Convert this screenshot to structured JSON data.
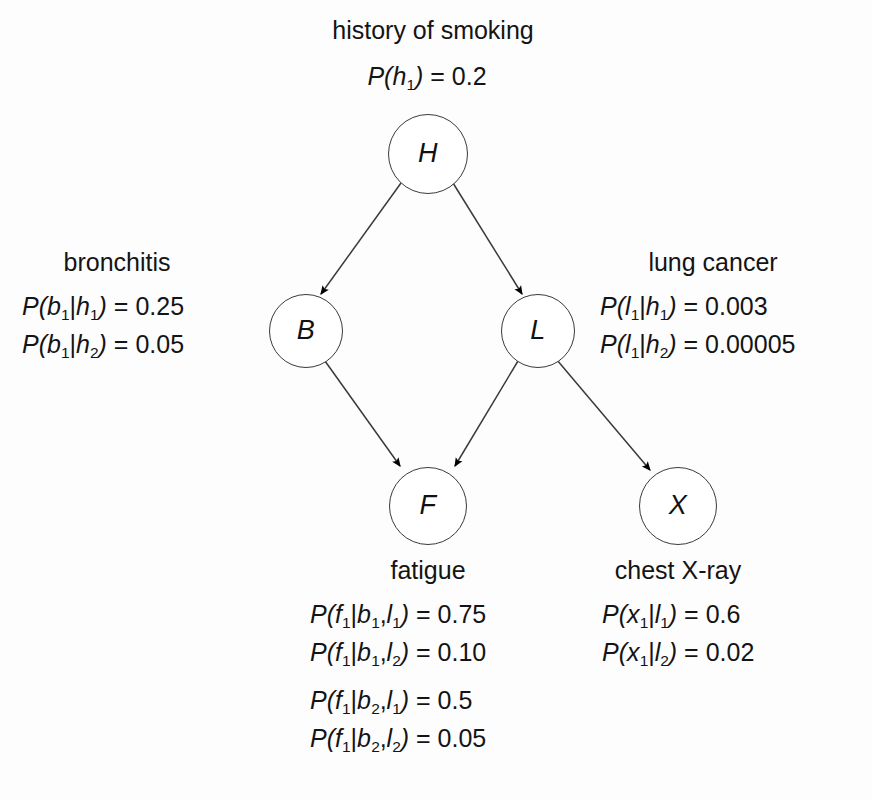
{
  "diagram": {
    "type": "bayesian-network",
    "nodes": [
      {
        "id": "H",
        "label": "H",
        "name": "history of smoking",
        "cx": 427,
        "cy": 153,
        "r": 39
      },
      {
        "id": "B",
        "label": "B",
        "name": "bronchitis",
        "cx": 305,
        "cy": 330,
        "r": 36
      },
      {
        "id": "L",
        "label": "L",
        "name": "lung cancer",
        "cx": 537,
        "cy": 330,
        "r": 36
      },
      {
        "id": "F",
        "label": "F",
        "name": "fatigue",
        "cx": 427,
        "cy": 505,
        "r": 38
      },
      {
        "id": "X",
        "label": "X",
        "name": "chest X-ray",
        "cx": 677,
        "cy": 505,
        "r": 38
      }
    ],
    "edges": [
      {
        "from": "H",
        "to": "B"
      },
      {
        "from": "H",
        "to": "L"
      },
      {
        "from": "B",
        "to": "F"
      },
      {
        "from": "L",
        "to": "F"
      },
      {
        "from": "L",
        "to": "X"
      }
    ]
  },
  "labels": {
    "smoking": {
      "caption": "history of smoking",
      "probabilities": [
        {
          "var": "P",
          "open": "(",
          "sym": "h",
          "sub": "1",
          "close": ")",
          "eq": " = ",
          "value": "0.2"
        }
      ]
    },
    "bronchitis": {
      "caption": "bronchitis",
      "probabilities": [
        {
          "lhs_sym": "b",
          "lhs_sub": "1",
          "cond_sym": "h",
          "cond_sub": "1",
          "value": "0.25"
        },
        {
          "lhs_sym": "b",
          "lhs_sub": "1",
          "cond_sym": "h",
          "cond_sub": "2",
          "value": "0.05"
        }
      ]
    },
    "lung_cancer": {
      "caption": "lung cancer",
      "probabilities": [
        {
          "lhs_sym": "l",
          "lhs_sub": "1",
          "cond_sym": "h",
          "cond_sub": "1",
          "value": "0.003"
        },
        {
          "lhs_sym": "l",
          "lhs_sub": "1",
          "cond_sym": "h",
          "cond_sub": "2",
          "value": "0.00005"
        }
      ]
    },
    "fatigue": {
      "caption": "fatigue",
      "probabilities": [
        {
          "lhs_sym": "f",
          "lhs_sub": "1",
          "c1_sym": "b",
          "c1_sub": "1",
          "c2_sym": "l",
          "c2_sub": "1",
          "value": "0.75"
        },
        {
          "lhs_sym": "f",
          "lhs_sub": "1",
          "c1_sym": "b",
          "c1_sub": "1",
          "c2_sym": "l",
          "c2_sub": "2",
          "value": "0.10"
        },
        {
          "lhs_sym": "f",
          "lhs_sub": "1",
          "c1_sym": "b",
          "c1_sub": "2",
          "c2_sym": "l",
          "c2_sub": "1",
          "value": "0.5"
        },
        {
          "lhs_sym": "f",
          "lhs_sub": "1",
          "c1_sym": "b",
          "c1_sub": "2",
          "c2_sym": "l",
          "c2_sub": "2",
          "value": "0.05"
        }
      ]
    },
    "chest_xray": {
      "caption": "chest X-ray",
      "probabilities": [
        {
          "lhs_sym": "x",
          "lhs_sub": "1",
          "cond_sym": "l",
          "cond_sub": "1",
          "value": "0.6"
        },
        {
          "lhs_sym": "x",
          "lhs_sub": "1",
          "cond_sym": "l",
          "cond_sub": "2",
          "value": "0.02"
        }
      ]
    }
  },
  "text": {
    "P": "P",
    "lparen": "(",
    "rparen": ")",
    "pipe": "|",
    "comma": ",",
    "equals": "="
  },
  "colors": {
    "background": "#fdfdfd",
    "stroke": "#3a3a3a",
    "text": "#141414",
    "arrowhead": "#000000"
  }
}
